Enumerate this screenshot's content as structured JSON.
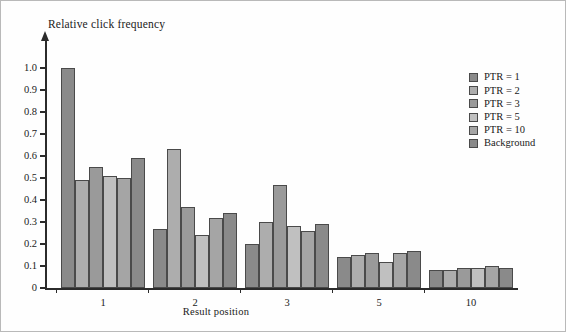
{
  "chart_data": {
    "type": "bar",
    "title": "",
    "xlabel": "Result position",
    "ylabel": "Relative click frequency",
    "categories": [
      "1",
      "2",
      "3",
      "5",
      "10"
    ],
    "ylim": [
      0,
      1.0
    ],
    "yticks": [
      "0",
      "0.1",
      "0.2",
      "0.3",
      "0.4",
      "0.5",
      "0.6",
      "0.7",
      "0.8",
      "0.9",
      "1.0"
    ],
    "ytick_values": [
      0,
      0.1,
      0.2,
      0.3,
      0.4,
      0.5,
      0.6,
      0.7,
      0.8,
      0.9,
      1.0
    ],
    "grid": false,
    "legend_position": "right",
    "series": [
      {
        "name": "PTR = 1",
        "color": "#8a8a8a",
        "values": [
          1.0,
          0.27,
          0.2,
          0.14,
          0.08
        ]
      },
      {
        "name": "PTR = 2",
        "color": "#adadad",
        "values": [
          0.49,
          0.63,
          0.3,
          0.15,
          0.08
        ]
      },
      {
        "name": "PTR = 3",
        "color": "#9a9a9a",
        "values": [
          0.55,
          0.37,
          0.47,
          0.16,
          0.09
        ]
      },
      {
        "name": "PTR = 5",
        "color": "#c0c0c0",
        "values": [
          0.51,
          0.24,
          0.28,
          0.12,
          0.09
        ]
      },
      {
        "name": "PTR = 10",
        "color": "#a5a5a5",
        "values": [
          0.5,
          0.32,
          0.26,
          0.16,
          0.1
        ]
      },
      {
        "name": "Background",
        "color": "#8a8a8a",
        "values": [
          0.59,
          0.34,
          0.29,
          0.17,
          0.09
        ]
      }
    ]
  },
  "legend": {
    "items": [
      {
        "label": "PTR = 1"
      },
      {
        "label": "PTR = 2"
      },
      {
        "label": "PTR = 3"
      },
      {
        "label": "PTR = 5"
      },
      {
        "label": "PTR = 10"
      },
      {
        "label": "Background"
      }
    ]
  }
}
